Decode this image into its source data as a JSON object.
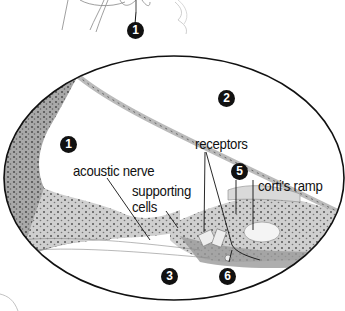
{
  "diagram": {
    "colors": {
      "outline": "#111111",
      "tissue": "#c9c9c9",
      "tissue_dark": "#7a7a7a",
      "badge_bg": "#111111",
      "badge_fg": "#ffffff"
    },
    "badges": [
      {
        "id": "top-1",
        "text": "1"
      },
      {
        "id": "chamber-1",
        "text": "1"
      },
      {
        "id": "chamber-2",
        "text": "2"
      },
      {
        "id": "chamber-3",
        "text": "3"
      },
      {
        "id": "marker-5",
        "text": "5"
      },
      {
        "id": "marker-6",
        "text": "6"
      }
    ],
    "labels": {
      "receptors": "receptors",
      "acoustic_nerve": "acoustic nerve",
      "supporting": "supporting",
      "cells": "cells",
      "cortis_ramp": "corti's ramp"
    }
  }
}
